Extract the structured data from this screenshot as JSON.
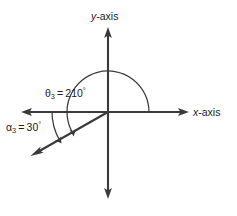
{
  "figure": {
    "background_color": "#ffffff",
    "line_color": "#3a3a3a",
    "text_color": "#1d1d1d",
    "axes": {
      "x_label": "x-axis",
      "x_label_italic_part": "x",
      "x_label_rest": "-axis",
      "y_label": "y-axis",
      "y_label_italic_part": "y",
      "y_label_rest": "-axis"
    },
    "labels": {
      "theta": {
        "symbol": "θ",
        "subscript": "3",
        "equals": "=",
        "value": "210",
        "degree": "°",
        "full_text": "θ₃ = 210°"
      },
      "alpha": {
        "symbol": "α",
        "subscript": "3",
        "equals": "=",
        "value": "30",
        "degree": "°",
        "full_text": "α₃ = 30°"
      }
    }
  },
  "chart_data": {
    "type": "diagram",
    "title": "",
    "xlabel": "x-axis",
    "ylabel": "y-axis",
    "origin": [
      108,
      112
    ],
    "axis_extent": {
      "x_min": 22,
      "x_max": 188,
      "y_min": 28,
      "y_max": 198
    },
    "angles": [
      {
        "name": "θ₃",
        "value": 210,
        "unit": "degrees",
        "measured_from": "positive x-axis",
        "direction": "counterclockwise",
        "label": "θ₃ = 210°"
      },
      {
        "name": "α₃",
        "value": 30,
        "unit": "degrees",
        "measured_from": "negative x-axis",
        "direction": "clockwise",
        "label": "α₃ = 30°"
      }
    ],
    "rays": [
      {
        "name": "terminal-side",
        "angle_degrees": 210,
        "length_px": 88,
        "arrow": "end"
      }
    ],
    "grid": false,
    "legend": null
  }
}
